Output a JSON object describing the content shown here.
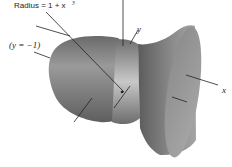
{
  "figure": {
    "labels": {
      "radius": "Radius = 1 + x",
      "radius_exp": "3",
      "y_eq": "(y = −1)",
      "y_axis": "y",
      "x_axis": "x"
    },
    "colors": {
      "surface_dark": "#5a5a5a",
      "surface_mid": "#8a8a8a",
      "surface_light": "#b8b8b8",
      "line": "#222222"
    }
  }
}
